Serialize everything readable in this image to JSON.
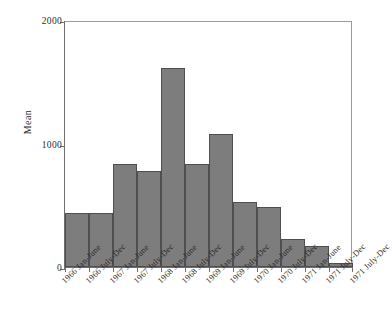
{
  "chart_data": {
    "type": "bar",
    "title": "",
    "subtitle": "",
    "xlabel": "",
    "ylabel": "Mean",
    "ylim": [
      0,
      2000
    ],
    "yticks": [
      0,
      1000,
      2000
    ],
    "ytick_labels": [
      "0",
      "1000",
      "2000"
    ],
    "grid": false,
    "legend": null,
    "bar_color": "#7d7d7d",
    "bar_edge_color": "#4f4f4f",
    "axis_color": "#6e6e6e",
    "categories": [
      "1966 Jan-June",
      "1966 July-Dec",
      "1967 Jan-June",
      "1967 July-Dec",
      "1968 Jan-June",
      "1968 July-Dec",
      "1969 Jan-June",
      "1969 July-Dec",
      "1970 Jan-June",
      "1970 July-Dec",
      "1971 Jan-June",
      "1971 July-Dec"
    ],
    "values": [
      440,
      435,
      835,
      775,
      1615,
      835,
      1075,
      525,
      490,
      225,
      170,
      35
    ],
    "xtick_labels": [
      "1966 Jan-June",
      "1966 July-Dec",
      "1967 Jan-June",
      "1967 July-Dec",
      "1968 Jan-June",
      "1968 July-Dec",
      "1969 Jan-June",
      "1969 July-Dec",
      "1970 Jan-June",
      "1970 July-Dec",
      "1971 Jan-June",
      "1971 July-Dec",
      "1971 July-Dec"
    ]
  }
}
